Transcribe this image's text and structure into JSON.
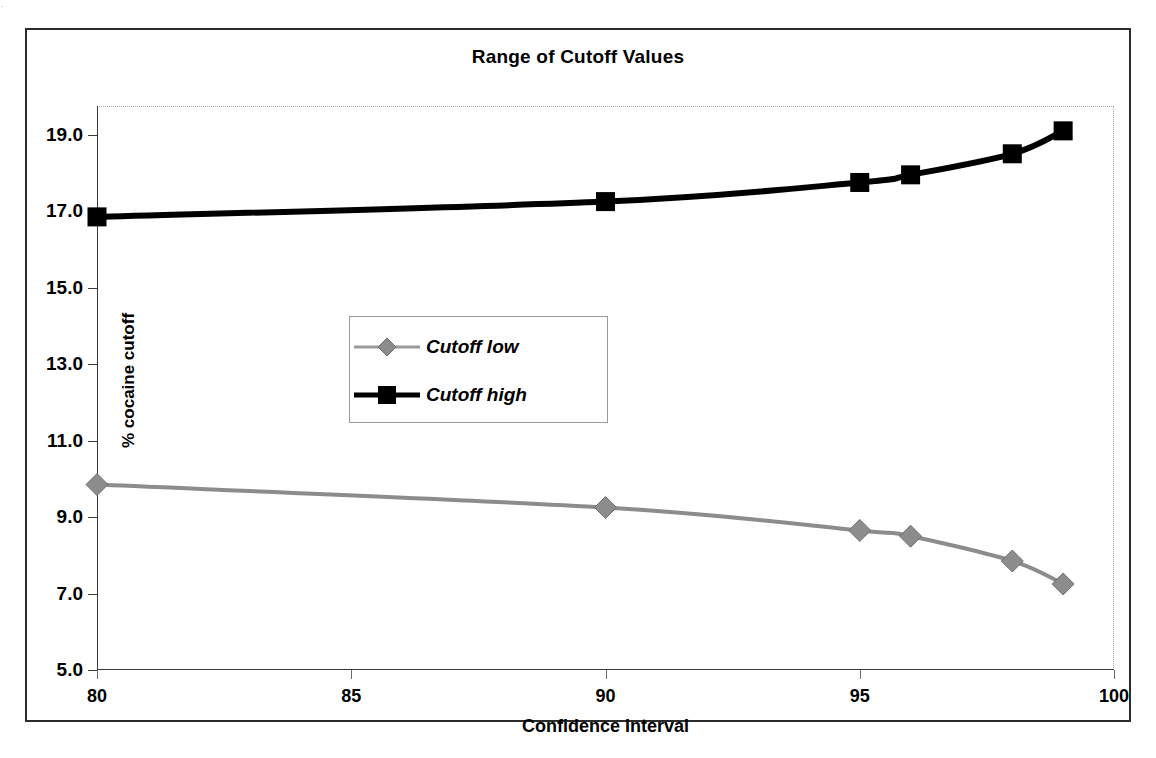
{
  "scan_artifact": "·",
  "chart_data": {
    "type": "line",
    "title": "Range of Cutoff Values",
    "xlabel": "Confidence Interval",
    "ylabel": "% cocaine cutoff",
    "x": [
      80,
      90,
      95,
      96,
      98,
      99
    ],
    "series": [
      {
        "name": "Cutoff low",
        "marker": "diamond",
        "color": "#8c8c8c",
        "values": [
          9.85,
          9.25,
          8.65,
          8.5,
          7.85,
          7.25
        ]
      },
      {
        "name": "Cutoff high",
        "marker": "square",
        "color": "#000000",
        "values": [
          16.85,
          17.25,
          17.75,
          17.95,
          18.5,
          19.1
        ]
      }
    ],
    "xlim": [
      80,
      100
    ],
    "ylim": [
      5.0,
      19.75
    ],
    "xticks": [
      "80",
      "85",
      "90",
      "95",
      "100"
    ],
    "xtick_values": [
      80,
      85,
      90,
      95,
      100
    ],
    "yticks": [
      "5.0",
      "7.0",
      "9.0",
      "11.0",
      "13.0",
      "15.0",
      "17.0",
      "19.0"
    ],
    "ytick_values": [
      5.0,
      7.0,
      9.0,
      11.0,
      13.0,
      15.0,
      17.0,
      19.0
    ],
    "grid": false,
    "legend_position": "inside-center-left"
  },
  "legend": {
    "entries": [
      {
        "label": "Cutoff low"
      },
      {
        "label": "Cutoff high"
      }
    ]
  }
}
